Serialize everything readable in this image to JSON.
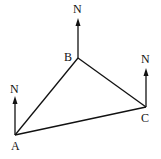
{
  "diagram": {
    "type": "triangle-bearings",
    "vertices": [
      {
        "label": "A",
        "x": 15,
        "y": 135
      },
      {
        "label": "B",
        "x": 78,
        "y": 58
      },
      {
        "label": "C",
        "x": 146,
        "y": 107
      }
    ],
    "north_label": "N",
    "north_arrows": [
      {
        "at": "A",
        "label": "N"
      },
      {
        "at": "B",
        "label": "N"
      },
      {
        "at": "C",
        "label": "N"
      }
    ],
    "edges": [
      [
        "A",
        "B"
      ],
      [
        "B",
        "C"
      ],
      [
        "C",
        "A"
      ]
    ],
    "colors": {
      "line": "#111111",
      "background": "#ffffff"
    }
  }
}
